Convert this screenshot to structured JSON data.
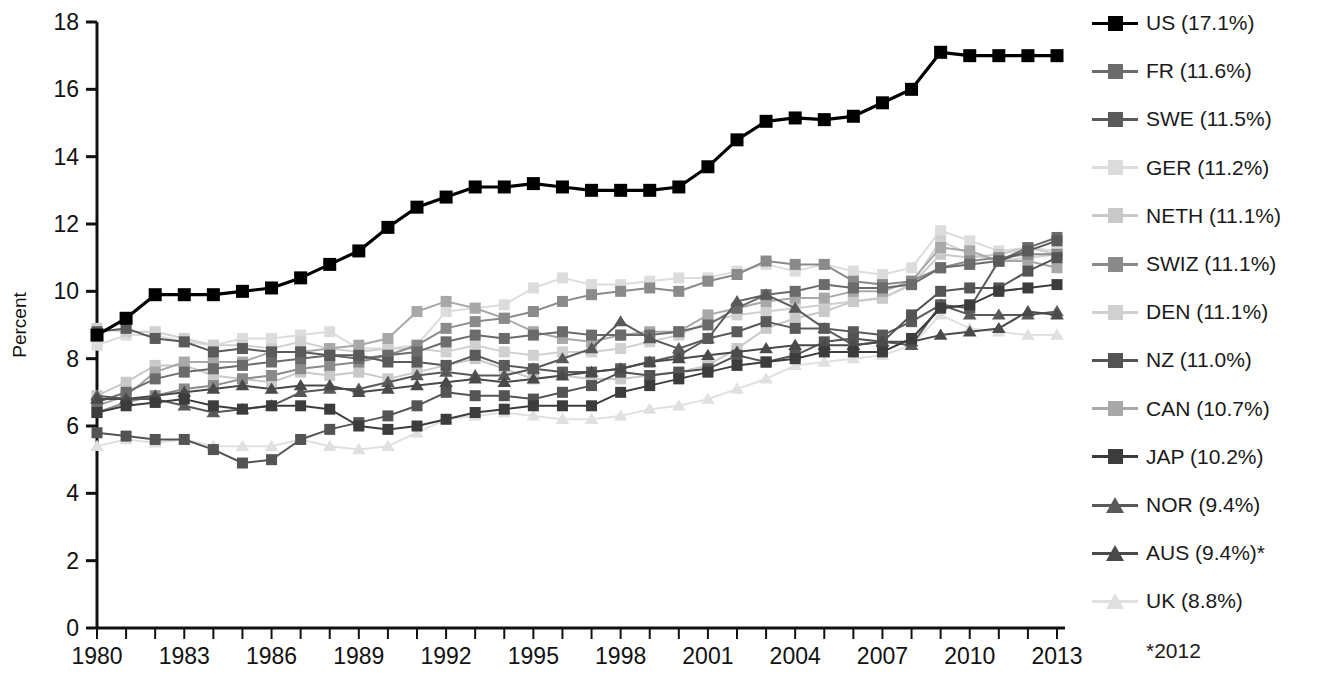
{
  "chart_data": {
    "type": "line",
    "title": "",
    "subtitle": "",
    "xlabel": "",
    "ylabel": "Percent",
    "xlim": [
      1980,
      2013
    ],
    "ylim": [
      0,
      18
    ],
    "yticks": [
      0,
      2,
      4,
      6,
      8,
      10,
      12,
      14,
      16,
      18
    ],
    "xticks_major": [
      1980,
      1983,
      1986,
      1989,
      1992,
      1995,
      1998,
      2001,
      2004,
      2007,
      2010,
      2013
    ],
    "xticks_minor_every": 1,
    "grid": false,
    "legend_position": "right",
    "annotation": "*2012",
    "x": [
      1980,
      1981,
      1982,
      1983,
      1984,
      1985,
      1986,
      1987,
      1988,
      1989,
      1990,
      1991,
      1992,
      1993,
      1994,
      1995,
      1996,
      1997,
      1998,
      1999,
      2000,
      2001,
      2002,
      2003,
      2004,
      2005,
      2006,
      2007,
      2008,
      2009,
      2010,
      2011,
      2012,
      2013
    ],
    "series": [
      {
        "name": "US",
        "label": "US (17.1%)",
        "marker": "square",
        "color": "#000000",
        "last_value": 17.1,
        "values": [
          8.7,
          9.2,
          9.9,
          9.9,
          9.9,
          10.0,
          10.1,
          10.4,
          10.8,
          11.2,
          11.9,
          12.5,
          12.8,
          13.1,
          13.1,
          13.2,
          13.1,
          13.0,
          13.0,
          13.0,
          13.1,
          13.7,
          14.5,
          15.05,
          15.15,
          15.1,
          15.2,
          15.6,
          16.0,
          17.1,
          17.0,
          17.0,
          17.0,
          17.0
        ]
      },
      {
        "name": "FR",
        "label": "FR (11.6%)",
        "marker": "square",
        "color": "#6b6b6b",
        "last_value": 11.6,
        "values": [
          6.7,
          7.0,
          7.4,
          7.6,
          7.7,
          7.8,
          7.9,
          8.0,
          8.1,
          8.0,
          8.1,
          8.2,
          8.5,
          8.7,
          8.6,
          8.7,
          8.8,
          8.7,
          8.7,
          8.7,
          8.8,
          9.0,
          9.5,
          9.9,
          10.0,
          10.2,
          10.1,
          10.1,
          10.2,
          10.7,
          10.8,
          10.9,
          11.3,
          11.6
        ]
      },
      {
        "name": "SWE",
        "label": "SWE (11.5%)",
        "marker": "square",
        "color": "#5a5a5a",
        "last_value": 11.5,
        "values": [
          8.8,
          8.9,
          8.6,
          8.5,
          8.2,
          8.3,
          8.2,
          8.2,
          8.1,
          8.1,
          7.9,
          7.9,
          7.8,
          8.1,
          7.8,
          7.7,
          7.6,
          7.6,
          7.7,
          7.9,
          8.1,
          8.6,
          8.8,
          9.1,
          8.9,
          8.9,
          8.8,
          8.7,
          9.1,
          9.6,
          9.5,
          10.9,
          11.2,
          11.5
        ]
      },
      {
        "name": "GER",
        "label": "GER (11.2%)",
        "marker": "square",
        "color": "#dcdcdc",
        "last_value": 11.2,
        "values": [
          8.4,
          8.7,
          8.7,
          8.5,
          8.4,
          8.6,
          8.6,
          8.7,
          8.8,
          8.3,
          8.3,
          8.4,
          9.4,
          9.5,
          9.6,
          10.1,
          10.4,
          10.2,
          10.2,
          10.3,
          10.4,
          10.4,
          10.6,
          10.8,
          10.6,
          10.8,
          10.6,
          10.5,
          10.7,
          11.8,
          11.5,
          11.2,
          11.3,
          11.2
        ]
      },
      {
        "name": "NETH",
        "label": "NETH (11.1%)",
        "marker": "square",
        "color": "#c9c9c9",
        "last_value": 11.1,
        "values": [
          6.9,
          7.3,
          7.8,
          7.8,
          7.5,
          7.4,
          7.3,
          7.6,
          7.5,
          7.6,
          7.4,
          7.6,
          7.8,
          8.0,
          7.7,
          7.4,
          7.5,
          7.4,
          7.4,
          7.5,
          7.6,
          7.8,
          8.3,
          8.9,
          9.2,
          9.4,
          9.7,
          9.8,
          10.2,
          11.1,
          11.0,
          11.1,
          11.3,
          11.1
        ]
      },
      {
        "name": "SWIZ",
        "label": "SWIZ (11.1%)",
        "marker": "square",
        "color": "#8a8a8a",
        "last_value": 11.1,
        "values": [
          6.4,
          6.7,
          6.9,
          7.1,
          7.2,
          7.4,
          7.5,
          7.7,
          7.8,
          7.9,
          8.1,
          8.4,
          8.9,
          9.1,
          9.2,
          9.4,
          9.7,
          9.9,
          10.0,
          10.1,
          10.0,
          10.3,
          10.5,
          10.9,
          10.8,
          10.8,
          10.3,
          10.2,
          10.3,
          10.7,
          10.9,
          11.0,
          11.1,
          11.1
        ]
      },
      {
        "name": "DEN",
        "label": "DEN (11.1%)",
        "marker": "square",
        "color": "#d0d0d0",
        "last_value": 11.1,
        "values": [
          8.9,
          8.8,
          8.8,
          8.6,
          8.4,
          8.4,
          8.3,
          8.5,
          8.3,
          8.2,
          8.3,
          8.3,
          8.2,
          8.4,
          8.2,
          8.1,
          8.2,
          8.2,
          8.3,
          8.5,
          8.7,
          9.1,
          9.3,
          9.4,
          9.5,
          9.6,
          9.7,
          9.8,
          10.2,
          11.5,
          11.1,
          10.9,
          11.0,
          11.1
        ]
      },
      {
        "name": "NZ",
        "label": "NZ (11.0%)",
        "marker": "square",
        "color": "#545454",
        "last_value": 11.0,
        "values": [
          5.8,
          5.7,
          5.6,
          5.6,
          5.3,
          4.9,
          5.0,
          5.6,
          5.9,
          6.1,
          6.3,
          6.6,
          7.0,
          6.9,
          6.9,
          6.8,
          7.0,
          7.2,
          7.6,
          7.5,
          7.6,
          7.7,
          8.1,
          7.9,
          8.1,
          8.5,
          8.6,
          8.5,
          9.3,
          10.0,
          10.1,
          10.1,
          10.6,
          11.0
        ]
      },
      {
        "name": "CAN",
        "label": "CAN (10.7%)",
        "marker": "square",
        "color": "#a8a8a8",
        "last_value": 10.7,
        "values": [
          6.6,
          6.9,
          7.6,
          7.9,
          7.9,
          7.9,
          8.2,
          8.2,
          8.3,
          8.4,
          8.6,
          9.4,
          9.7,
          9.5,
          9.2,
          8.8,
          8.6,
          8.5,
          8.7,
          8.8,
          8.8,
          9.3,
          9.5,
          9.7,
          9.8,
          9.8,
          10.0,
          10.0,
          10.3,
          11.3,
          11.2,
          10.9,
          10.9,
          10.7
        ]
      },
      {
        "name": "JAP",
        "label": "JAP (10.2%)",
        "marker": "square",
        "color": "#3c3c3c",
        "last_value": 10.2,
        "values": [
          6.4,
          6.6,
          6.7,
          6.8,
          6.6,
          6.5,
          6.6,
          6.6,
          6.5,
          6.0,
          5.9,
          6.0,
          6.2,
          6.4,
          6.5,
          6.6,
          6.6,
          6.6,
          7.0,
          7.2,
          7.4,
          7.6,
          7.8,
          7.9,
          8.0,
          8.2,
          8.2,
          8.2,
          8.6,
          9.5,
          9.6,
          10.0,
          10.1,
          10.2
        ]
      },
      {
        "name": "NOR",
        "label": "NOR (9.4%)",
        "marker": "triangle",
        "color": "#595959",
        "last_value": 9.4,
        "values": [
          6.9,
          6.8,
          6.8,
          6.6,
          6.4,
          6.5,
          6.6,
          7.0,
          7.1,
          7.1,
          7.3,
          7.5,
          7.6,
          7.5,
          7.5,
          7.7,
          8.0,
          8.3,
          9.1,
          8.6,
          8.3,
          8.6,
          9.7,
          9.9,
          9.5,
          8.9,
          8.4,
          8.5,
          8.4,
          9.6,
          9.3,
          9.3,
          9.3,
          9.4
        ]
      },
      {
        "name": "AUS",
        "label": "AUS (9.4%)*",
        "marker": "triangle",
        "color": "#4a4a4a",
        "last_value": 9.4,
        "values": [
          6.8,
          6.8,
          6.9,
          7.0,
          7.1,
          7.2,
          7.1,
          7.2,
          7.2,
          7.0,
          7.1,
          7.2,
          7.3,
          7.4,
          7.3,
          7.4,
          7.5,
          7.6,
          7.7,
          7.9,
          8.0,
          8.1,
          8.2,
          8.3,
          8.4,
          8.4,
          8.4,
          8.5,
          8.5,
          8.7,
          8.8,
          8.9,
          9.4,
          9.3
        ]
      },
      {
        "name": "UK",
        "label": "UK (8.8%)",
        "marker": "triangle",
        "color": "#e0e0e0",
        "last_value": 8.8,
        "values": [
          5.4,
          5.6,
          5.5,
          5.6,
          5.4,
          5.4,
          5.4,
          5.6,
          5.4,
          5.3,
          5.4,
          5.8,
          6.2,
          6.3,
          6.4,
          6.3,
          6.2,
          6.2,
          6.3,
          6.5,
          6.6,
          6.8,
          7.1,
          7.4,
          7.8,
          7.9,
          8.0,
          8.1,
          8.4,
          9.3,
          8.9,
          8.8,
          8.7,
          8.7
        ]
      }
    ]
  },
  "axes": {
    "y_label": "Percent",
    "y_tick_labels": [
      "0",
      "2",
      "4",
      "6",
      "8",
      "10",
      "12",
      "14",
      "16",
      "18"
    ],
    "x_tick_labels": [
      "1980",
      "1983",
      "1986",
      "1989",
      "1992",
      "1995",
      "1998",
      "2001",
      "2004",
      "2007",
      "2010",
      "2013"
    ]
  },
  "legend": {
    "note": "*2012",
    "entries": [
      {
        "label": "US (17.1%)",
        "color": "#000000",
        "marker": "square"
      },
      {
        "label": "FR (11.6%)",
        "color": "#6b6b6b",
        "marker": "square"
      },
      {
        "label": "SWE (11.5%)",
        "color": "#5a5a5a",
        "marker": "square"
      },
      {
        "label": "GER (11.2%)",
        "color": "#dcdcdc",
        "marker": "square"
      },
      {
        "label": "NETH (11.1%)",
        "color": "#c9c9c9",
        "marker": "square"
      },
      {
        "label": "SWIZ (11.1%)",
        "color": "#8a8a8a",
        "marker": "square"
      },
      {
        "label": "DEN (11.1%)",
        "color": "#d0d0d0",
        "marker": "square"
      },
      {
        "label": "NZ (11.0%)",
        "color": "#545454",
        "marker": "square"
      },
      {
        "label": "CAN (10.7%)",
        "color": "#a8a8a8",
        "marker": "square"
      },
      {
        "label": "JAP (10.2%)",
        "color": "#3c3c3c",
        "marker": "square"
      },
      {
        "label": "NOR (9.4%)",
        "color": "#595959",
        "marker": "triangle"
      },
      {
        "label": "AUS (9.4%)*",
        "color": "#4a4a4a",
        "marker": "triangle"
      },
      {
        "label": "UK (8.8%)",
        "color": "#e0e0e0",
        "marker": "triangle"
      }
    ]
  }
}
